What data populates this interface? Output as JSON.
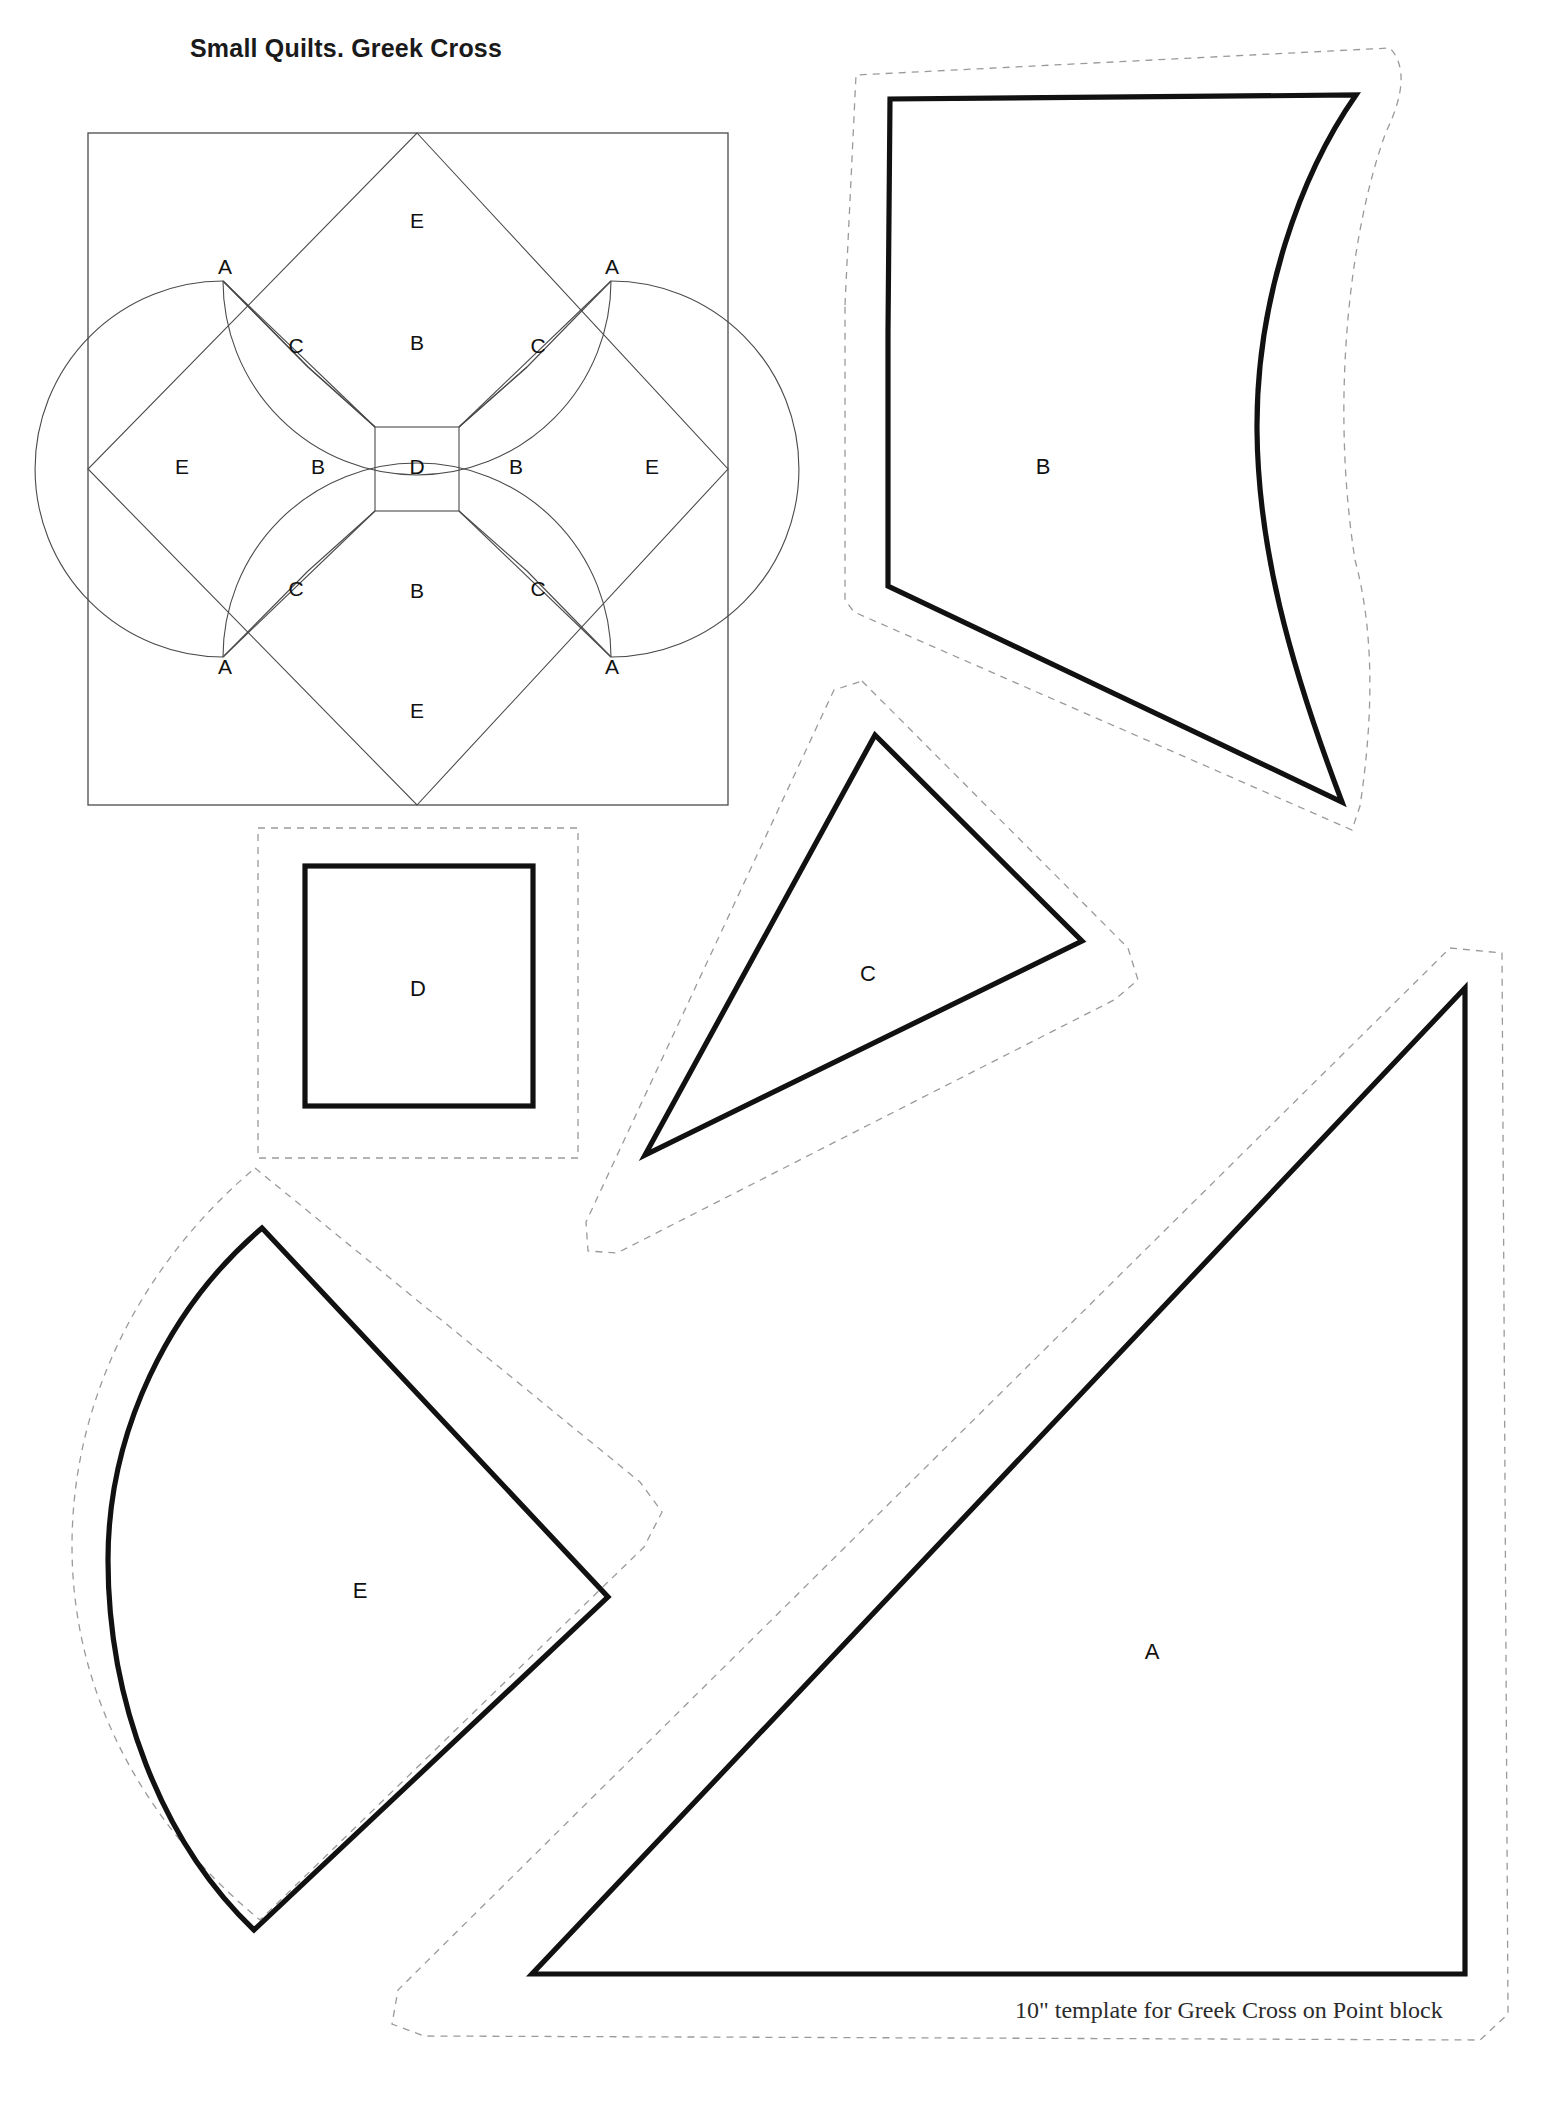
{
  "page": {
    "title": "Small Quilts. Greek Cross",
    "caption": "10\" template for Greek Cross on Point block",
    "width": 1542,
    "height": 2102,
    "background": "#ffffff",
    "ink_color": "#111111",
    "thin_line_color": "#4a4a4a",
    "dashed_seam_color": "#9a9a9a"
  },
  "block_diagram": {
    "name": "Greek Cross on Point block",
    "outer_frame": {
      "x": 88,
      "y": 133,
      "width": 640,
      "height": 672
    },
    "piece_labels": [
      {
        "key": "a_top_left",
        "label": "A",
        "x": 225,
        "y": 268
      },
      {
        "key": "a_top_right",
        "label": "A",
        "x": 612,
        "y": 268
      },
      {
        "key": "a_bottom_left",
        "label": "A",
        "x": 225,
        "y": 668
      },
      {
        "key": "a_bottom_right",
        "label": "A",
        "x": 612,
        "y": 668
      },
      {
        "key": "e_top",
        "label": "E",
        "x": 417,
        "y": 222
      },
      {
        "key": "e_left",
        "label": "E",
        "x": 182,
        "y": 468
      },
      {
        "key": "e_right",
        "label": "E",
        "x": 652,
        "y": 468
      },
      {
        "key": "e_bottom",
        "label": "E",
        "x": 417,
        "y": 712
      },
      {
        "key": "c_upper_left",
        "label": "C",
        "x": 296,
        "y": 347
      },
      {
        "key": "c_upper_right",
        "label": "C",
        "x": 538,
        "y": 347
      },
      {
        "key": "c_lower_left",
        "label": "C",
        "x": 296,
        "y": 590
      },
      {
        "key": "c_lower_right",
        "label": "C",
        "x": 538,
        "y": 590
      },
      {
        "key": "b_top",
        "label": "B",
        "x": 417,
        "y": 344
      },
      {
        "key": "b_left",
        "label": "B",
        "x": 318,
        "y": 468
      },
      {
        "key": "b_right",
        "label": "B",
        "x": 516,
        "y": 468
      },
      {
        "key": "b_bottom",
        "label": "B",
        "x": 417,
        "y": 592
      },
      {
        "key": "d_center",
        "label": "D",
        "x": 417,
        "y": 468
      }
    ]
  },
  "templates": [
    {
      "key": "template-b",
      "label": "B",
      "label_x": 1043,
      "label_y": 468,
      "shape": "curved-kite",
      "has_seam_allowance": true
    },
    {
      "key": "template-d",
      "label": "D",
      "label_x": 418,
      "label_y": 990,
      "shape": "square",
      "has_seam_allowance": true
    },
    {
      "key": "template-c",
      "label": "C",
      "label_x": 868,
      "label_y": 975,
      "shape": "triangle",
      "has_seam_allowance": true
    },
    {
      "key": "template-e",
      "label": "E",
      "label_x": 360,
      "label_y": 1592,
      "shape": "fan-wedge",
      "has_seam_allowance": true
    },
    {
      "key": "template-a",
      "label": "A",
      "label_x": 1152,
      "label_y": 1653,
      "shape": "right-triangle",
      "has_seam_allowance": true
    }
  ]
}
